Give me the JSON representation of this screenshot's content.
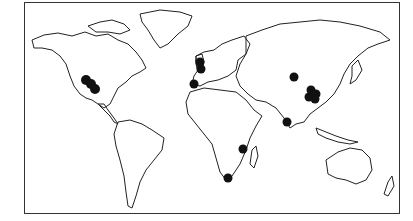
{
  "map": {
    "type": "world outline map",
    "style": "black-and-white line drawing",
    "colors": {
      "background": "#ffffff",
      "coastline": "#222222",
      "marker": "#111111",
      "frame": "#333333"
    },
    "markers": [
      {
        "id": "north-america-west-1",
        "x": 86,
        "y": 80,
        "r": 5
      },
      {
        "id": "north-america-west-2",
        "x": 91,
        "y": 84,
        "r": 5
      },
      {
        "id": "north-america-west-3",
        "x": 95,
        "y": 89,
        "r": 5
      },
      {
        "id": "british-isles-1",
        "x": 200,
        "y": 62,
        "r": 4.5
      },
      {
        "id": "british-isles-2",
        "x": 201,
        "y": 69,
        "r": 4.5
      },
      {
        "id": "iberia",
        "x": 194,
        "y": 84,
        "r": 4.5
      },
      {
        "id": "central-asia",
        "x": 294,
        "y": 77,
        "r": 4.5
      },
      {
        "id": "china-1",
        "x": 311,
        "y": 90,
        "r": 4.5
      },
      {
        "id": "china-2",
        "x": 316,
        "y": 94,
        "r": 4.5
      },
      {
        "id": "china-3",
        "x": 309,
        "y": 97,
        "r": 4.5
      },
      {
        "id": "china-4",
        "x": 315,
        "y": 99,
        "r": 4.5
      },
      {
        "id": "india-south",
        "x": 287,
        "y": 122,
        "r": 4.5
      },
      {
        "id": "east-africa",
        "x": 243,
        "y": 149,
        "r": 4.5
      },
      {
        "id": "south-africa",
        "x": 228,
        "y": 178,
        "r": 4.5
      }
    ]
  }
}
